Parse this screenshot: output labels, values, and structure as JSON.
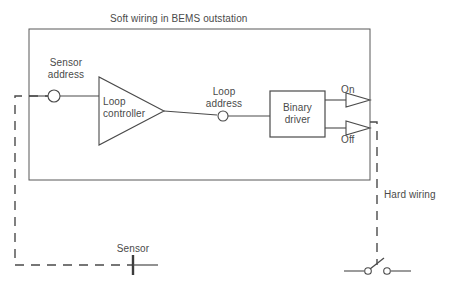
{
  "diagram": {
    "title": "Soft wiring in BEMS outstation",
    "type": "block-diagram",
    "colors": {
      "line": "#4a4a4a",
      "soft_box_border": "#595959",
      "hard_wiring_dash": "#4a4a4a",
      "text": "#4a4a4a",
      "background": "#ffffff"
    },
    "labels": {
      "soft_wiring_title": "Soft wiring in BEMS outstation",
      "sensor_address": "Sensor\naddress",
      "sensor_address_line1": "Sensor",
      "sensor_address_line2": "address",
      "loop_controller_line1": "Loop",
      "loop_controller_line2": "controller",
      "loop_address_line1": "Loop",
      "loop_address_line2": "address",
      "binary_driver_line1": "Binary",
      "binary_driver_line2": "driver",
      "output_on": "On",
      "output_off": "Off",
      "hard_wiring": "Hard wiring",
      "sensor": "Sensor"
    },
    "nodes": [
      {
        "name": "sensor-address-node",
        "shape": "circle",
        "label": "Sensor address"
      },
      {
        "name": "loop-controller",
        "shape": "triangle",
        "label": "Loop controller"
      },
      {
        "name": "loop-address-node",
        "shape": "circle",
        "label": "Loop address"
      },
      {
        "name": "binary-driver",
        "shape": "rectangle",
        "label": "Binary driver"
      },
      {
        "name": "output-on-arrow",
        "shape": "triangle-arrow",
        "label": "On"
      },
      {
        "name": "output-off-arrow",
        "shape": "triangle-arrow",
        "label": "Off"
      },
      {
        "name": "sensor-symbol",
        "shape": "bar",
        "label": "Sensor"
      },
      {
        "name": "switch-symbol",
        "shape": "switch",
        "label": ""
      }
    ],
    "connections": [
      {
        "from": "hard-wiring-left",
        "to": "sensor-address-node",
        "style": "solid"
      },
      {
        "from": "sensor-address-node",
        "to": "loop-controller",
        "style": "solid"
      },
      {
        "from": "loop-controller",
        "to": "loop-address-node",
        "style": "solid"
      },
      {
        "from": "loop-address-node",
        "to": "binary-driver",
        "style": "solid"
      },
      {
        "from": "binary-driver",
        "to": "output-on-arrow",
        "style": "solid"
      },
      {
        "from": "binary-driver",
        "to": "output-off-arrow",
        "style": "solid"
      },
      {
        "from": "output-off-arrow",
        "to": "switch-symbol",
        "style": "dashed"
      },
      {
        "from": "sensor-symbol",
        "to": "hard-wiring-left",
        "style": "dashed"
      }
    ]
  }
}
